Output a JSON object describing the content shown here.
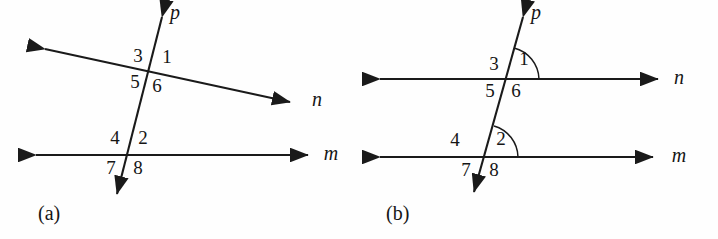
{
  "figure": {
    "ink_color": "#1a1a1a",
    "background_color": "#fefefe"
  },
  "panels": [
    {
      "id": "panel-a",
      "caption": "(a)",
      "description": "Transversal p crossing non-parallel lines n and m",
      "lines": [
        {
          "name": "p",
          "label": "p",
          "kind": "transversal",
          "arrows": "both"
        },
        {
          "name": "n",
          "label": "n",
          "kind": "slanted",
          "arrows": "both"
        },
        {
          "name": "m",
          "label": "m",
          "kind": "horizontal",
          "arrows": "both"
        }
      ],
      "angle_labels": [
        {
          "id": "a-3",
          "text": "3",
          "position": "upper-left-of-n-intersection"
        },
        {
          "id": "a-1",
          "text": "1",
          "position": "upper-right-of-n-intersection"
        },
        {
          "id": "a-5",
          "text": "5",
          "position": "lower-left-of-n-intersection"
        },
        {
          "id": "a-6",
          "text": "6",
          "position": "lower-right-of-n-intersection"
        },
        {
          "id": "a-4",
          "text": "4",
          "position": "upper-left-of-m-intersection"
        },
        {
          "id": "a-2",
          "text": "2",
          "position": "upper-right-of-m-intersection"
        },
        {
          "id": "a-7",
          "text": "7",
          "position": "lower-left-of-m-intersection"
        },
        {
          "id": "a-8",
          "text": "8",
          "position": "lower-right-of-m-intersection"
        }
      ],
      "arcs": []
    },
    {
      "id": "panel-b",
      "caption": "(b)",
      "description": "Transversal p crossing parallel lines n and m, with angle arcs on angles 1 and 2",
      "lines": [
        {
          "name": "p",
          "label": "p",
          "kind": "transversal",
          "arrows": "both"
        },
        {
          "name": "n",
          "label": "n",
          "kind": "horizontal",
          "arrows": "both"
        },
        {
          "name": "m",
          "label": "m",
          "kind": "horizontal",
          "arrows": "both"
        }
      ],
      "angle_labels": [
        {
          "id": "b-3",
          "text": "3",
          "position": "upper-left-of-n-intersection"
        },
        {
          "id": "b-1",
          "text": "1",
          "position": "upper-right-of-n-intersection"
        },
        {
          "id": "b-5",
          "text": "5",
          "position": "lower-left-of-n-intersection"
        },
        {
          "id": "b-6",
          "text": "6",
          "position": "lower-right-of-n-intersection"
        },
        {
          "id": "b-4",
          "text": "4",
          "position": "upper-left-of-m-intersection"
        },
        {
          "id": "b-2",
          "text": "2",
          "position": "upper-right-of-m-intersection"
        },
        {
          "id": "b-7",
          "text": "7",
          "position": "lower-left-of-m-intersection"
        },
        {
          "id": "b-8",
          "text": "8",
          "position": "lower-right-of-m-intersection"
        }
      ],
      "arcs": [
        {
          "id": "b-arc-1",
          "for_angle": "1"
        },
        {
          "id": "b-arc-2",
          "for_angle": "2"
        }
      ]
    }
  ]
}
